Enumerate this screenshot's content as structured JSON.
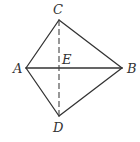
{
  "diagram": {
    "title": "",
    "points": {
      "A": {
        "label": "A",
        "x": 26,
        "y": 68,
        "label_x": 13,
        "label_y": 73
      },
      "B": {
        "label": "B",
        "x": 122,
        "y": 68,
        "label_x": 127,
        "label_y": 73
      },
      "C": {
        "label": "C",
        "x": 59,
        "y": 20,
        "label_x": 53,
        "label_y": 14
      },
      "D": {
        "label": "D",
        "x": 59,
        "y": 116,
        "label_x": 53,
        "label_y": 132
      },
      "E": {
        "label": "E",
        "x": 59,
        "y": 68,
        "label_x": 62,
        "label_y": 64
      }
    },
    "segments": [
      {
        "from": "A",
        "to": "C",
        "style": "solid"
      },
      {
        "from": "C",
        "to": "B",
        "style": "solid"
      },
      {
        "from": "B",
        "to": "D",
        "style": "solid"
      },
      {
        "from": "D",
        "to": "A",
        "style": "solid"
      },
      {
        "from": "A",
        "to": "B",
        "style": "solid"
      },
      {
        "from": "C",
        "to": "D",
        "style": "dashed"
      }
    ],
    "colors": {
      "line": "#333333",
      "background": "#ffffff"
    }
  }
}
